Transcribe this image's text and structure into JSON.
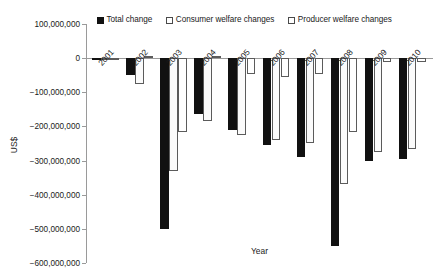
{
  "chart_data": {
    "type": "bar",
    "title": "",
    "xlabel": "Year",
    "ylabel": "US$",
    "categories": [
      "2001",
      "2002",
      "2003",
      "2004",
      "2005",
      "2006",
      "2007",
      "2008",
      "2009",
      "2010"
    ],
    "ylim": [
      -600000000,
      100000000
    ],
    "ytick_values": [
      100000000,
      0,
      -100000000,
      -200000000,
      -300000000,
      -400000000,
      -500000000,
      -600000000
    ],
    "ytick_labels": [
      "100,000,000",
      "0",
      "−100,000,000",
      "−200,000,000",
      "−300,000,000",
      "−400,000,000",
      "−500,000,000",
      "−600,000,000"
    ],
    "grid": false,
    "legend_position": "top",
    "series": [
      {
        "name": "Total change",
        "style": "filled",
        "color": "#111111",
        "values": [
          -3000000,
          -50000000,
          -500000000,
          -165000000,
          -210000000,
          -255000000,
          -290000000,
          -550000000,
          -300000000,
          -295000000
        ]
      },
      {
        "name": "Consumer welfare changes",
        "style": "open",
        "color": "#ffffff",
        "values": [
          -2000000,
          -75000000,
          -330000000,
          -185000000,
          -225000000,
          -240000000,
          -250000000,
          -370000000,
          -275000000,
          -265000000
        ]
      },
      {
        "name": "Producer welfare changes",
        "style": "open",
        "color": "#ffffff",
        "values": [
          1000000,
          5000000,
          -215000000,
          5000000,
          -45000000,
          -55000000,
          -45000000,
          -215000000,
          -10000000,
          -10000000
        ]
      }
    ]
  },
  "axes": {
    "ylabel": "US$",
    "xlabel": "Year"
  },
  "legend": {
    "items": [
      {
        "label": "Total change",
        "marker": "filled-square-marker"
      },
      {
        "label": "Consumer welfare changes",
        "marker": "open-square-marker"
      },
      {
        "label": "Producer welfare changes",
        "marker": "open-square-marker"
      }
    ]
  }
}
